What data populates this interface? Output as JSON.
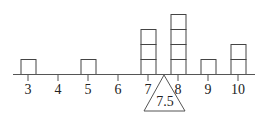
{
  "chart_data": {
    "type": "dot-plot",
    "title": "",
    "categories": [
      "3",
      "4",
      "5",
      "6",
      "7",
      "8",
      "9",
      "10"
    ],
    "values": [
      1,
      0,
      1,
      0,
      3,
      4,
      1,
      2
    ],
    "balance_point": {
      "value": 7.5,
      "label": "7.5"
    },
    "xlabel": "",
    "ylabel": "",
    "grid": false
  },
  "colors": {
    "stroke": "#444444",
    "background": "#ffffff"
  }
}
